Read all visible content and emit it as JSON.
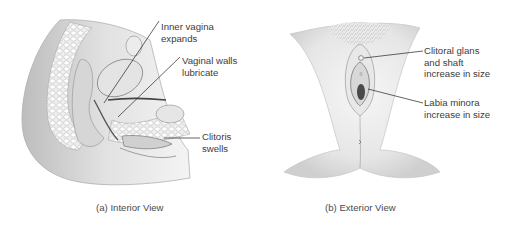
{
  "figure": {
    "panels": [
      {
        "id": "a",
        "caption": "(a) Interior View",
        "labels": [
          {
            "text": "Inner vagina\nexpands",
            "target": "inner-vagina"
          },
          {
            "text": "Vaginal walls\nlubricate",
            "target": "vaginal-walls"
          },
          {
            "text": "Clitoris\nswells",
            "target": "clitoris"
          }
        ]
      },
      {
        "id": "b",
        "caption": "(b) Exterior View",
        "labels": [
          {
            "text": "Clitoral glans\nand shaft\nincrease in size",
            "target": "clitoral-glans"
          },
          {
            "text": "Labia minora\nincrease in size",
            "target": "labia-minora"
          }
        ]
      }
    ],
    "colors": {
      "background": "#ffffff",
      "label_text": "#3c3c3c",
      "leader_line": "#222222",
      "illustration_shade": "#c8c8c8"
    }
  }
}
